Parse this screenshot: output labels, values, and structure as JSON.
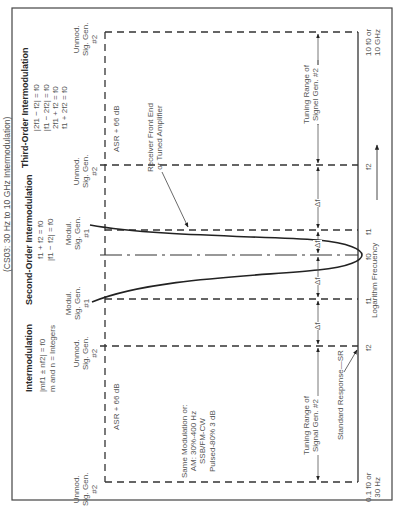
{
  "figure": {
    "orientation": "rotated 90 degrees counter-clockwise",
    "title": "(CS03: 30 Hz to 10 GHz Intermodulation)",
    "x_axis": {
      "label": "Logarithm Frecuency",
      "ticks": [
        {
          "id": "low",
          "line1": "0.1 f0 or",
          "line2": "30 Hz"
        },
        {
          "id": "f2_low",
          "label": "f2"
        },
        {
          "id": "f1_low",
          "label": "f1"
        },
        {
          "id": "f0",
          "label": "f0"
        },
        {
          "id": "f1_high",
          "label": "f1"
        },
        {
          "id": "f2_high",
          "label": "f2"
        },
        {
          "id": "high",
          "line1": "10 f0 or",
          "line2": "10 GHz"
        }
      ]
    },
    "blocks": {
      "intermodulation": {
        "heading": "Intermodulation",
        "eq1": "|mf1 ± nf2| = f0",
        "eq2": "m and n = Integers"
      },
      "second_order": {
        "heading": "Second-Order Intermodulation",
        "eq1": "f1 + f2 = f0",
        "eq2": "|f1 − f2| = f0"
      },
      "third_order": {
        "heading": "Third-Order Intermodulation",
        "eq1": "|2f1 − f2| = f0",
        "eq2": "|f1 − 2f2| = f0",
        "eq3": "2f1 + f2 = f0",
        "eq4": "f1 + 2f2 = f0"
      }
    },
    "generators": {
      "unmod_l1": "Unmod.",
      "unmod_l2": "Sig. Gen.",
      "unmod_l3": "#2",
      "mod_l1": "Modul.",
      "mod_l2": "Sig. Gen.",
      "mod_l3": "#1"
    },
    "levels": {
      "asr_low": "ASR + 66 dB",
      "asr_high": "ASR + 66 dB"
    },
    "modulation_note": {
      "l1": "Same Modulation or:",
      "l2": "AM: 30%-400 Hz",
      "l3": "SSB/FM-CW",
      "l4": "Pulsed-80% 3 dB"
    },
    "callouts": {
      "receiver_l1": "Receiver Front End",
      "receiver_l2": "or Tuned Amplifier",
      "standard_response": "Standard Response—SR"
    },
    "dimensions": {
      "tuning_l1": "Tuning Range of",
      "tuning_l2_low": "Signal Gen. #2",
      "tuning_l2_high": "Signel Gen. #2",
      "delta": "Δf"
    }
  }
}
